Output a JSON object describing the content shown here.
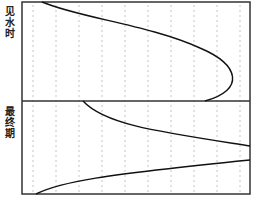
{
  "diagram": {
    "labels": {
      "top_section": "见水时",
      "bottom_section": "最终期"
    },
    "frame": {
      "left": 22,
      "right": 250,
      "top": 2,
      "middle": 101,
      "bottom": 194
    },
    "dashed_columns_x": [
      33,
      56,
      79,
      102,
      125,
      148,
      171,
      194,
      217,
      240
    ],
    "top_curve": {
      "description": "Water front at breakthrough: curve from top-left bowing to the right, returning to the divider",
      "path": "M 42 2 C 80 18, 150 25, 200 48 C 240 65, 245 90, 205 101"
    },
    "bottom_curves": [
      {
        "name": "upper-front",
        "path": "M 83 101 C 105 125, 160 132, 250 146"
      },
      {
        "name": "lower-front",
        "path": "M 36 194 C 60 182, 100 175, 250 160"
      }
    ],
    "colors": {
      "frame": "#333333",
      "curve": "#111111",
      "dash": "#b5b5b5"
    },
    "caption": ""
  }
}
